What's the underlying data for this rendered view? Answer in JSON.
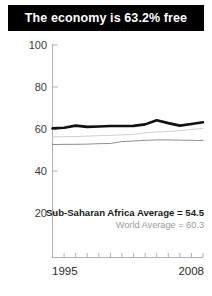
{
  "banner": {
    "title": "The economy is 63.2% free"
  },
  "annotations": {
    "primary": "Sub-Saharan Africa Average = 54.5",
    "secondary": "World Average = 60.3"
  },
  "colors": {
    "banner_bg": "#000000",
    "banner_text": "#ffffff",
    "series_country": "#111111",
    "series_world": "#c9c9c9",
    "series_region": "#8f8f8f",
    "axis": "#b0b0b0",
    "tick_label": "#3c3c3c"
  },
  "chart_data": {
    "type": "line",
    "title": "The economy is 63.2% free",
    "xlabel": "",
    "ylabel": "",
    "xlim": [
      1995,
      2008
    ],
    "ylim": [
      0,
      100
    ],
    "grid": false,
    "legend_position": "none",
    "x_tick_labels": [
      "1995",
      "2008"
    ],
    "y_tick_labels": [
      "20",
      "40",
      "60",
      "80",
      "100"
    ],
    "y_ticks": [
      20,
      40,
      60,
      80,
      100
    ],
    "x": [
      1995,
      1996,
      1997,
      1998,
      1999,
      2000,
      2001,
      2002,
      2003,
      2004,
      2005,
      2006,
      2007,
      2008
    ],
    "series": [
      {
        "name": "Country economic freedom",
        "color": "#111111",
        "values": [
          60.3,
          60.6,
          61.6,
          61.0,
          61.2,
          61.4,
          61.4,
          61.5,
          62.2,
          64.2,
          62.8,
          61.6,
          62.4,
          63.2
        ]
      },
      {
        "name": "World Average",
        "color": "#c9c9c9",
        "values": [
          56.3,
          56.3,
          56.4,
          56.6,
          56.8,
          57.0,
          57.2,
          57.4,
          58.2,
          58.6,
          58.8,
          59.2,
          59.8,
          60.3
        ]
      },
      {
        "name": "Sub-Saharan Africa Average",
        "color": "#8f8f8f",
        "values": [
          52.6,
          52.7,
          52.7,
          52.8,
          53.0,
          53.1,
          54.0,
          54.3,
          54.6,
          54.8,
          54.8,
          54.7,
          54.6,
          54.5
        ]
      }
    ],
    "annotations": [
      {
        "text": "Sub-Saharan Africa Average = 54.5",
        "value": 54.5
      },
      {
        "text": "World Average = 60.3",
        "value": 60.3
      }
    ]
  }
}
